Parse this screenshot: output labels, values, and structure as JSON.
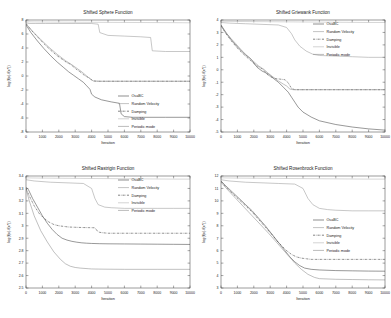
{
  "figure": {
    "background": "#ffffff",
    "layout": "2x2 grid of convergence plots"
  },
  "legend": {
    "entries": [
      {
        "label": "OsaBC",
        "color": "#444444",
        "style": "solid"
      },
      {
        "label": "Random Velocity",
        "color": "#9a9a9a",
        "style": "solid"
      },
      {
        "label": "Damping",
        "color": "#333333",
        "style": "dashdot"
      },
      {
        "label": "Invisible",
        "color": "#b5b5b5",
        "style": "solid"
      },
      {
        "label": "Periodic mode",
        "color": "#8c8c8c",
        "style": "solid"
      }
    ]
  },
  "chart_data": [
    {
      "type": "line",
      "title": "Shifted Sphere Function",
      "xlabel": "Iteration",
      "ylabel": "log(f(x)-f(x*))",
      "xlim": [
        0,
        10000
      ],
      "ylim": [
        -8,
        8
      ],
      "xticks": [
        0,
        1000,
        2000,
        3000,
        4000,
        5000,
        6000,
        7000,
        8000,
        9000,
        10000
      ],
      "yticks": [
        -8,
        -6,
        -4,
        -2,
        0,
        2,
        4,
        6,
        8
      ],
      "grid": false,
      "legend_position": "lower right",
      "series": [
        {
          "name": "OsaBC",
          "x": [
            0,
            300,
            700,
            1100,
            1500,
            1900,
            2300,
            2600,
            2900,
            3200,
            3500,
            3700,
            3900,
            4000,
            4200,
            4600,
            5200,
            5700,
            5800,
            6000,
            6500,
            7500,
            8500,
            10000
          ],
          "y": [
            7.3,
            6.2,
            5.0,
            3.9,
            2.9,
            2.0,
            1.2,
            0.6,
            0.1,
            -0.4,
            -0.9,
            -1.4,
            -1.9,
            -2.6,
            -3.0,
            -3.4,
            -3.7,
            -3.9,
            -5.4,
            -5.8,
            -5.9,
            -5.9,
            -5.9,
            -5.9
          ]
        },
        {
          "name": "Random Velocity",
          "x": [
            0,
            200,
            600,
            1200,
            2000,
            3000,
            4000,
            4400,
            4500,
            5000,
            6000,
            7000,
            7600,
            7700,
            8500,
            10000
          ],
          "y": [
            7.6,
            7.5,
            7.5,
            7.5,
            7.5,
            7.5,
            7.5,
            7.4,
            6.2,
            5.8,
            5.7,
            5.6,
            5.5,
            3.6,
            3.5,
            3.5
          ]
        },
        {
          "name": "Damping",
          "x": [
            0,
            300,
            700,
            1100,
            1500,
            1900,
            2200,
            2500,
            2700,
            2900,
            3100,
            3300,
            3500,
            3700,
            3900,
            4000,
            4100,
            4300,
            5000,
            6000,
            7000,
            8000,
            9000,
            10000
          ],
          "y": [
            7.5,
            6.6,
            5.6,
            4.6,
            3.7,
            2.9,
            2.4,
            1.9,
            1.7,
            1.3,
            0.9,
            0.6,
            0.2,
            -0.1,
            -0.3,
            -0.55,
            -0.7,
            -0.75,
            -0.75,
            -0.75,
            -0.75,
            -0.75,
            -0.75,
            -0.75
          ]
        },
        {
          "name": "Invisible",
          "x": [
            0,
            500,
            1500,
            3000,
            5000,
            7000,
            9000,
            10000
          ],
          "y": [
            7.75,
            7.72,
            7.7,
            7.68,
            7.66,
            7.64,
            7.62,
            7.6
          ]
        },
        {
          "name": "Periodic mode",
          "x": [
            0,
            400,
            900,
            1400,
            1900,
            2400,
            2800,
            3100,
            3400,
            3600,
            3800,
            3950,
            4100,
            4500,
            6000,
            8000,
            10000
          ],
          "y": [
            7.45,
            6.4,
            5.2,
            4.1,
            3.1,
            2.2,
            1.6,
            1.1,
            0.6,
            0.2,
            -0.2,
            -0.5,
            -0.7,
            -0.75,
            -0.75,
            -0.75,
            -0.75
          ]
        }
      ]
    },
    {
      "type": "line",
      "title": "Shifted Griewank Function",
      "xlabel": "Iteration",
      "ylabel": "log(f(x)-f(x*))",
      "xlim": [
        0,
        10000
      ],
      "ylim": [
        -5,
        4
      ],
      "xticks": [
        0,
        1000,
        2000,
        3000,
        4000,
        5000,
        6000,
        7000,
        8000,
        9000,
        10000
      ],
      "yticks": [
        -5,
        -4,
        -3,
        -2,
        -1,
        0,
        1,
        2,
        3,
        4
      ],
      "grid": false,
      "legend_position": "upper right",
      "series": [
        {
          "name": "OsaBC",
          "x": [
            0,
            300,
            700,
            1100,
            1500,
            1800,
            2000,
            2200,
            2500,
            2900,
            3200,
            3500,
            3800,
            4100,
            4300,
            4500,
            4700,
            5000,
            5500,
            6000,
            7000,
            8000,
            9000,
            10000
          ],
          "y": [
            3.6,
            3.0,
            2.3,
            1.7,
            1.2,
            0.9,
            0.55,
            0.2,
            -0.1,
            -0.35,
            -0.7,
            -1.0,
            -1.4,
            -1.8,
            -2.2,
            -2.6,
            -3.0,
            -3.4,
            -3.8,
            -4.1,
            -4.4,
            -4.6,
            -4.75,
            -4.85
          ]
        },
        {
          "name": "Random Velocity",
          "x": [
            0,
            500,
            1500,
            2500,
            3500,
            4000,
            4300,
            4500,
            4800,
            5200,
            5600,
            6000,
            7000,
            8000,
            9000,
            10000
          ],
          "y": [
            3.8,
            3.75,
            3.7,
            3.65,
            3.6,
            3.4,
            2.9,
            2.4,
            1.9,
            1.5,
            1.25,
            1.15,
            1.1,
            1.05,
            1.0,
            1.0
          ]
        },
        {
          "name": "Damping",
          "x": [
            0,
            300,
            700,
            1100,
            1500,
            1800,
            2100,
            2400,
            2600,
            2800,
            3000,
            3300,
            3600,
            3900,
            4100,
            4300,
            4500,
            5000,
            6000,
            7000,
            8000,
            9000,
            10000
          ],
          "y": [
            3.55,
            2.9,
            2.2,
            1.6,
            1.1,
            0.75,
            0.4,
            0.15,
            0.0,
            -0.35,
            -0.55,
            -0.7,
            -0.75,
            -0.8,
            -1.05,
            -1.5,
            -1.6,
            -1.6,
            -1.6,
            -1.6,
            -1.6,
            -1.6,
            -1.6
          ]
        },
        {
          "name": "Invisible",
          "x": [
            0,
            1000,
            3000,
            5000,
            7000,
            9000,
            10000
          ],
          "y": [
            3.9,
            3.88,
            3.86,
            3.84,
            3.82,
            3.8,
            3.8
          ]
        },
        {
          "name": "Periodic mode",
          "x": [
            0,
            400,
            900,
            1300,
            1700,
            2000,
            2300,
            2600,
            2900,
            3200,
            3500,
            3800,
            4000,
            4200,
            4400,
            5000,
            6000,
            8000,
            10000
          ],
          "y": [
            3.5,
            2.8,
            2.1,
            1.5,
            1.0,
            0.65,
            0.3,
            0.05,
            -0.3,
            -0.6,
            -0.9,
            -1.15,
            -1.3,
            -1.55,
            -1.6,
            -1.6,
            -1.6,
            -1.6,
            -1.6
          ]
        }
      ]
    },
    {
      "type": "line",
      "title": "Shifted Rastrigin Function",
      "xlabel": "Iteration",
      "ylabel": "log(f(x)-f(x*))",
      "xlim": [
        0,
        10000
      ],
      "ylim": [
        2.5,
        3.4
      ],
      "xticks": [
        0,
        1000,
        2000,
        3000,
        4000,
        5000,
        6000,
        7000,
        8000,
        9000,
        10000
      ],
      "yticks": [
        2.5,
        2.6,
        2.7,
        2.8,
        2.9,
        3.0,
        3.1,
        3.2,
        3.3,
        3.4
      ],
      "grid": false,
      "legend_position": "upper right",
      "series": [
        {
          "name": "OsaBC",
          "x": [
            0,
            150,
            400,
            700,
            1000,
            1300,
            1600,
            1900,
            2200,
            2500,
            2800,
            3100,
            3400,
            3700,
            4000,
            4500,
            5000,
            6000,
            7000,
            8000,
            9000,
            10000
          ],
          "y": [
            3.31,
            3.29,
            3.22,
            3.15,
            3.08,
            3.02,
            2.97,
            2.93,
            2.9,
            2.885,
            2.875,
            2.868,
            2.863,
            2.86,
            2.858,
            2.856,
            2.855,
            2.854,
            2.853,
            2.852,
            2.851,
            2.85
          ]
        },
        {
          "name": "Random Velocity",
          "x": [
            0,
            500,
            1500,
            2500,
            3500,
            4000,
            4200,
            4400,
            4800,
            5200,
            6000,
            7000,
            8000,
            9000,
            10000
          ],
          "y": [
            3.37,
            3.36,
            3.35,
            3.345,
            3.34,
            3.3,
            3.22,
            3.17,
            3.15,
            3.145,
            3.14,
            3.14,
            3.14,
            3.14,
            3.14
          ]
        },
        {
          "name": "Damping",
          "x": [
            0,
            200,
            500,
            800,
            1100,
            1400,
            1700,
            2000,
            2300,
            2600,
            3000,
            3400,
            3800,
            4200,
            4400,
            4600,
            5000,
            6000,
            8000,
            10000
          ],
          "y": [
            3.3,
            3.24,
            3.16,
            3.1,
            3.06,
            3.03,
            3.01,
            3.0,
            2.995,
            2.99,
            2.988,
            2.986,
            2.985,
            2.984,
            2.95,
            2.945,
            2.94,
            2.94,
            2.94,
            2.94
          ]
        },
        {
          "name": "Invisible",
          "x": [
            0,
            1000,
            3000,
            5000,
            7000,
            9000,
            10000
          ],
          "y": [
            3.385,
            3.383,
            3.381,
            3.379,
            3.377,
            3.375,
            3.375
          ]
        },
        {
          "name": "Periodic mode",
          "x": [
            0,
            200,
            500,
            900,
            1300,
            1700,
            2100,
            2400,
            2700,
            3000,
            3300,
            3600,
            3800,
            4000,
            4400,
            5000,
            6000,
            8000,
            10000
          ],
          "y": [
            3.3,
            3.2,
            3.08,
            2.96,
            2.87,
            2.79,
            2.73,
            2.695,
            2.675,
            2.665,
            2.66,
            2.657,
            2.655,
            2.653,
            2.652,
            2.651,
            2.65,
            2.65,
            2.65
          ]
        }
      ]
    },
    {
      "type": "line",
      "title": "Shifted Rosenbrock Function",
      "xlabel": "Iteration",
      "ylabel": "log(f(x)-f(x*))",
      "xlim": [
        0,
        10000
      ],
      "ylim": [
        3,
        12
      ],
      "xticks": [
        0,
        1000,
        2000,
        3000,
        4000,
        5000,
        6000,
        7000,
        8000,
        9000,
        10000
      ],
      "yticks": [
        3,
        4,
        5,
        6,
        7,
        8,
        9,
        10,
        11,
        12
      ],
      "grid": false,
      "legend_position": "center right",
      "series": [
        {
          "name": "OsaBC",
          "x": [
            0,
            300,
            700,
            1100,
            1500,
            1900,
            2300,
            2700,
            3000,
            3300,
            3600,
            3900,
            4200,
            4500,
            4800,
            5100,
            5500,
            6000,
            7000,
            8000,
            9000,
            10000
          ],
          "y": [
            11.6,
            11.2,
            10.7,
            10.2,
            9.7,
            9.2,
            8.6,
            8.0,
            7.5,
            7.0,
            6.5,
            6.0,
            5.5,
            5.1,
            4.8,
            4.6,
            4.5,
            4.45,
            4.4,
            4.38,
            4.36,
            4.35
          ]
        },
        {
          "name": "Random Velocity",
          "x": [
            0,
            500,
            1500,
            2500,
            3500,
            4500,
            5000,
            5300,
            5600,
            6000,
            6500,
            7000,
            8000,
            9000,
            10000
          ],
          "y": [
            11.7,
            11.6,
            11.5,
            11.45,
            11.4,
            11.35,
            11.0,
            10.2,
            9.7,
            9.4,
            9.3,
            9.25,
            9.2,
            9.2,
            9.2
          ]
        },
        {
          "name": "Damping",
          "x": [
            0,
            300,
            700,
            1100,
            1500,
            1900,
            2300,
            2700,
            3100,
            3400,
            3700,
            4000,
            4300,
            4600,
            4900,
            5200,
            5500,
            6000,
            7000,
            8000,
            9000,
            10000
          ],
          "y": [
            11.55,
            11.1,
            10.6,
            10.1,
            9.6,
            9.1,
            8.5,
            7.9,
            7.3,
            6.8,
            6.4,
            6.0,
            5.7,
            5.5,
            5.4,
            5.35,
            5.3,
            5.3,
            5.3,
            5.3,
            5.3,
            5.3
          ]
        },
        {
          "name": "Invisible",
          "x": [
            0,
            1000,
            3000,
            5000,
            7000,
            9000,
            10000
          ],
          "y": [
            11.85,
            11.83,
            11.81,
            11.79,
            11.77,
            11.75,
            11.75
          ]
        },
        {
          "name": "Periodic mode",
          "x": [
            0,
            400,
            900,
            1400,
            1900,
            2400,
            2900,
            3300,
            3700,
            4100,
            4500,
            4900,
            5300,
            5700,
            6000,
            7000,
            8000,
            9000,
            10000
          ],
          "y": [
            11.5,
            10.9,
            10.2,
            9.5,
            8.8,
            8.1,
            7.4,
            6.8,
            6.2,
            5.6,
            5.0,
            4.5,
            4.1,
            3.85,
            3.75,
            3.7,
            3.68,
            3.66,
            3.65
          ]
        }
      ]
    }
  ]
}
